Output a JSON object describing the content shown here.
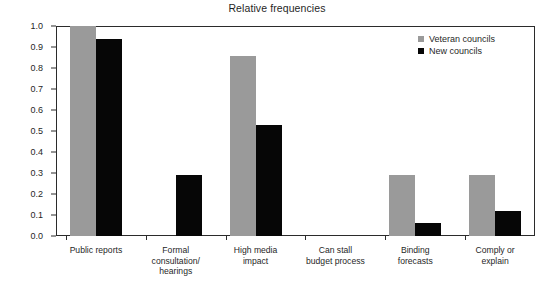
{
  "chart_data": {
    "type": "bar",
    "title": "Relative frequencies",
    "xlabel": "",
    "ylabel": "",
    "ylim": [
      0.0,
      1.0
    ],
    "grid": false,
    "legend_position": "top-right",
    "categories": [
      "Public reports",
      "Formal\nconsultation/\nhearings",
      "High media\nimpact",
      "Can stall\nbudget process",
      "Binding\nforecasts",
      "Comply or\nexplain"
    ],
    "series": [
      {
        "name": "Veteran councils",
        "color": "#9a9a9a",
        "values": [
          1.0,
          0.0,
          0.855,
          0.0,
          0.29,
          0.29
        ]
      },
      {
        "name": "New councils",
        "color": "#060606",
        "values": [
          0.94,
          0.29,
          0.53,
          0.0,
          0.06,
          0.12
        ]
      }
    ],
    "ytick_labels": [
      "0.0",
      "0.1",
      "0.2",
      "0.3",
      "0.4",
      "0.5",
      "0.6",
      "0.7",
      "0.8",
      "0.9",
      "1.0"
    ],
    "ytick_values": [
      0.0,
      0.1,
      0.2,
      0.3,
      0.4,
      0.5,
      0.6,
      0.7,
      0.8,
      0.9,
      1.0
    ]
  },
  "axis_color": "#2b2b2b"
}
